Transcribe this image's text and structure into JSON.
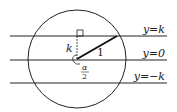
{
  "diagram": {
    "type": "geometry",
    "circle": {
      "cx": 77,
      "cy": 59,
      "r": 49
    },
    "lines": [
      {
        "id": "upper",
        "y": 36,
        "label": "y=k"
      },
      {
        "id": "middle",
        "y": 60,
        "label": "y=0"
      },
      {
        "id": "lower",
        "y": 83,
        "label": "y=−k"
      }
    ],
    "labels": {
      "k": "k",
      "radius": "1",
      "alpha": "α",
      "two": "2"
    },
    "colors": {
      "stroke": "#222222",
      "background": "#ffffff"
    }
  }
}
